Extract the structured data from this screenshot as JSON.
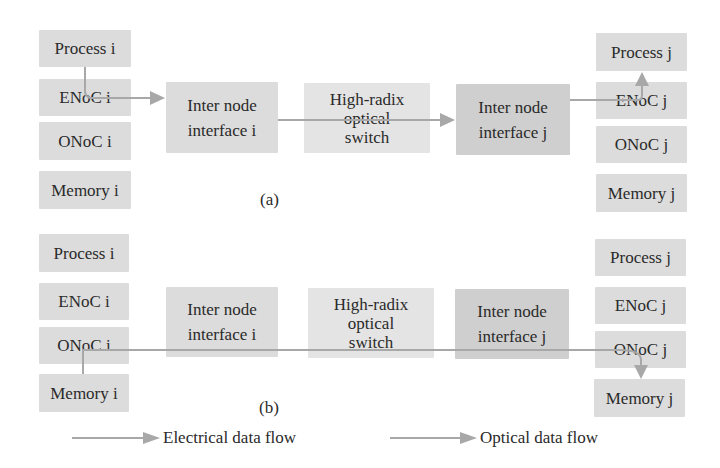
{
  "diagram_a": {
    "label": "(a)",
    "left_column": [
      {
        "id": "process-i",
        "label": "Process i"
      },
      {
        "id": "enoc-i",
        "label": "ENoC i"
      },
      {
        "id": "onoc-i",
        "label": "ONoC i"
      },
      {
        "id": "memory-i",
        "label": "Memory i"
      }
    ],
    "inter_node_i": {
      "line1": "Inter node",
      "line2": "interface i"
    },
    "switch": {
      "line1": "High-radix",
      "line2": "optical",
      "line3": "switch"
    },
    "inter_node_j": {
      "line1": "Inter node",
      "line2": "interface j"
    },
    "right_column": [
      {
        "id": "process-j",
        "label": "Process j"
      },
      {
        "id": "enoc-j",
        "label": "ENoC j"
      },
      {
        "id": "onoc-j",
        "label": "ONoC j"
      },
      {
        "id": "memory-j",
        "label": "Memory j"
      }
    ],
    "flow": "Process i → ENoC i → Inter node interface i → High-radix optical switch → Inter node interface j → ENoC j → Process j",
    "flow_type": "electrical"
  },
  "diagram_b": {
    "label": "(b)",
    "left_column": [
      {
        "id": "process-i",
        "label": "Process i"
      },
      {
        "id": "enoc-i",
        "label": "ENoC i"
      },
      {
        "id": "onoc-i",
        "label": "ONoC i"
      },
      {
        "id": "memory-i",
        "label": "Memory i"
      }
    ],
    "inter_node_i": {
      "line1": "Inter node",
      "line2": "interface i"
    },
    "switch": {
      "line1": "High-radix",
      "line2": "optical",
      "line3": "switch"
    },
    "inter_node_j": {
      "line1": "Inter node",
      "line2": "interface j"
    },
    "right_column": [
      {
        "id": "process-j",
        "label": "Process j"
      },
      {
        "id": "enoc-j",
        "label": "ENoC j"
      },
      {
        "id": "onoc-j",
        "label": "ONoC j"
      },
      {
        "id": "memory-j",
        "label": "Memory j"
      }
    ],
    "flow": "Memory i → ONoC i → (through interfaces and switch) → ONoC j → Memory j",
    "flow_type": "optical"
  },
  "legend": {
    "electrical": "Electrical data flow",
    "optical": "Optical data flow"
  },
  "colors": {
    "box_fill": "#dcdcdc",
    "box_fill_dark": "#cfcfcf",
    "arrow": "#a8a8a8",
    "text": "#2a2a2a"
  }
}
